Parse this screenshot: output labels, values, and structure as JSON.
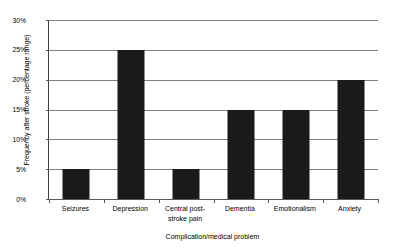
{
  "chart_data": {
    "type": "bar",
    "title": "",
    "xlabel": "Complication/medical problem",
    "ylabel": "Frequency after stroke (percentage range)",
    "categories": [
      "Seizures",
      "Depression",
      "Central post-stroke pain",
      "Dementia",
      "Emotionalism",
      "Anxiety"
    ],
    "values": [
      5,
      25,
      5,
      15,
      15,
      20
    ],
    "ylim": [
      0,
      30
    ],
    "ytick_values": [
      0,
      5,
      10,
      15,
      20,
      25,
      30
    ],
    "ytick_labels": [
      "0%",
      "5%",
      "10%",
      "15%",
      "20%",
      "25%",
      "30%"
    ],
    "grid": true,
    "legend": false,
    "bar_color": "#1a1a1a",
    "gridline_color": "#808080",
    "axis_color": "#595959",
    "background_color": "#ffffff"
  }
}
